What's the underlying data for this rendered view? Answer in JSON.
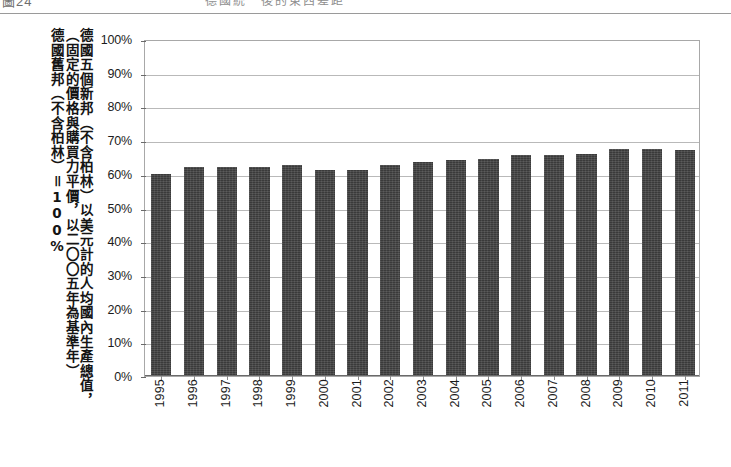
{
  "page_header": {
    "left_text": "圖24",
    "right_text": "德國統一後的東西差距"
  },
  "axis_title_columns": [
    "德國五個新邦（不含柏林）以美元計的人均國內生產總值，",
    "（固定的價格與購買力平價，以二〇〇五年為基準年）",
    "德國舊邦（不含柏林）＝100%"
  ],
  "chart_data": {
    "type": "bar",
    "title": "",
    "xlabel": "",
    "ylabel": "德國五個新邦（不含柏林）以美元計的人均國內生產總值，（固定的價格與購買力平價，以二〇〇五年為基準年）德國舊邦（不含柏林）＝100%",
    "categories": [
      "1995",
      "1996",
      "1997",
      "1998",
      "1999",
      "2000",
      "2001",
      "2002",
      "2003",
      "2004",
      "2005",
      "2006",
      "2007",
      "2008",
      "2009",
      "2010",
      "2011"
    ],
    "values": [
      60,
      62,
      62,
      62,
      62.5,
      61,
      61,
      62.5,
      63.5,
      64,
      64.5,
      65.5,
      65.5,
      66,
      67.5,
      67.5,
      67
    ],
    "value_labels": [
      "60%",
      "62%",
      "62%",
      "62%",
      "63%",
      "61%",
      "61%",
      "63%",
      "64%",
      "64%",
      "65%",
      "66%",
      "66%",
      "66%",
      "68%",
      "68%",
      "67%"
    ],
    "ylim": [
      0,
      100
    ],
    "ytick_labels": [
      "100%",
      "90%",
      "80%",
      "70%",
      "60%",
      "50%",
      "40%",
      "30%",
      "20%",
      "10%",
      "0%"
    ],
    "ytick_values": [
      100,
      90,
      80,
      70,
      60,
      50,
      40,
      30,
      20,
      10,
      0
    ],
    "grid": true,
    "legend": false,
    "series_color": "#3a3a3a",
    "gridline_color": "#b9b9b9",
    "axis_color": "#6a6a6a",
    "background": "#ffffff"
  }
}
